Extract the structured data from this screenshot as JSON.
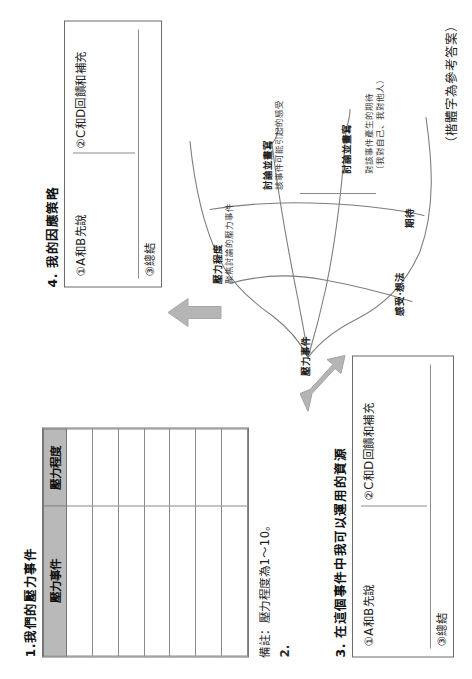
{
  "sections": {
    "one": {
      "title": "1.我們的壓力事件",
      "table": {
        "headers": [
          "壓力事件",
          "壓力程度"
        ],
        "rows": [
          [
            "",
            ""
          ],
          [
            "",
            ""
          ],
          [
            "",
            ""
          ],
          [
            "",
            ""
          ],
          [
            "",
            ""
          ],
          [
            "",
            ""
          ],
          [
            "",
            ""
          ]
        ]
      },
      "note": "備註：壓力程度為1～10。"
    },
    "two": {
      "title": "2."
    },
    "three": {
      "title": "3. 在這個事件中我可以運用的資源",
      "slot1": "①A和B先說",
      "slot2": "②C和D回饋和補充",
      "slot3": "③總結"
    },
    "four": {
      "title": "4. 我的因應策略",
      "slot1": "①A和B先說",
      "slot2": "②C和D回饋和補充",
      "slot3": "③總結"
    }
  },
  "mindmap": {
    "center": "壓力事件",
    "branches": [
      {
        "label": "壓力程度",
        "detail": "聚焦討論的壓力事件"
      },
      {
        "label": "感受‧想法",
        "detail": ""
      },
      {
        "label": "討論並畫寫",
        "detail": "該事件可能引起的感受"
      },
      {
        "label": "期待",
        "detail": ""
      },
      {
        "label": "討論並畫寫",
        "detail": "對該事件產生的期待\n（我對自己、我對他人）"
      }
    ]
  },
  "arrows": {
    "to_section_three": "arrow-up-left",
    "to_section_four": "arrow-up"
  },
  "footer": "（楷體字為參考答案）",
  "colors": {
    "header_fill": "#b9b9b9",
    "arrow_fill": "#b5b5b5",
    "border": "#6b6b6b",
    "text": "#1d1d1d"
  }
}
